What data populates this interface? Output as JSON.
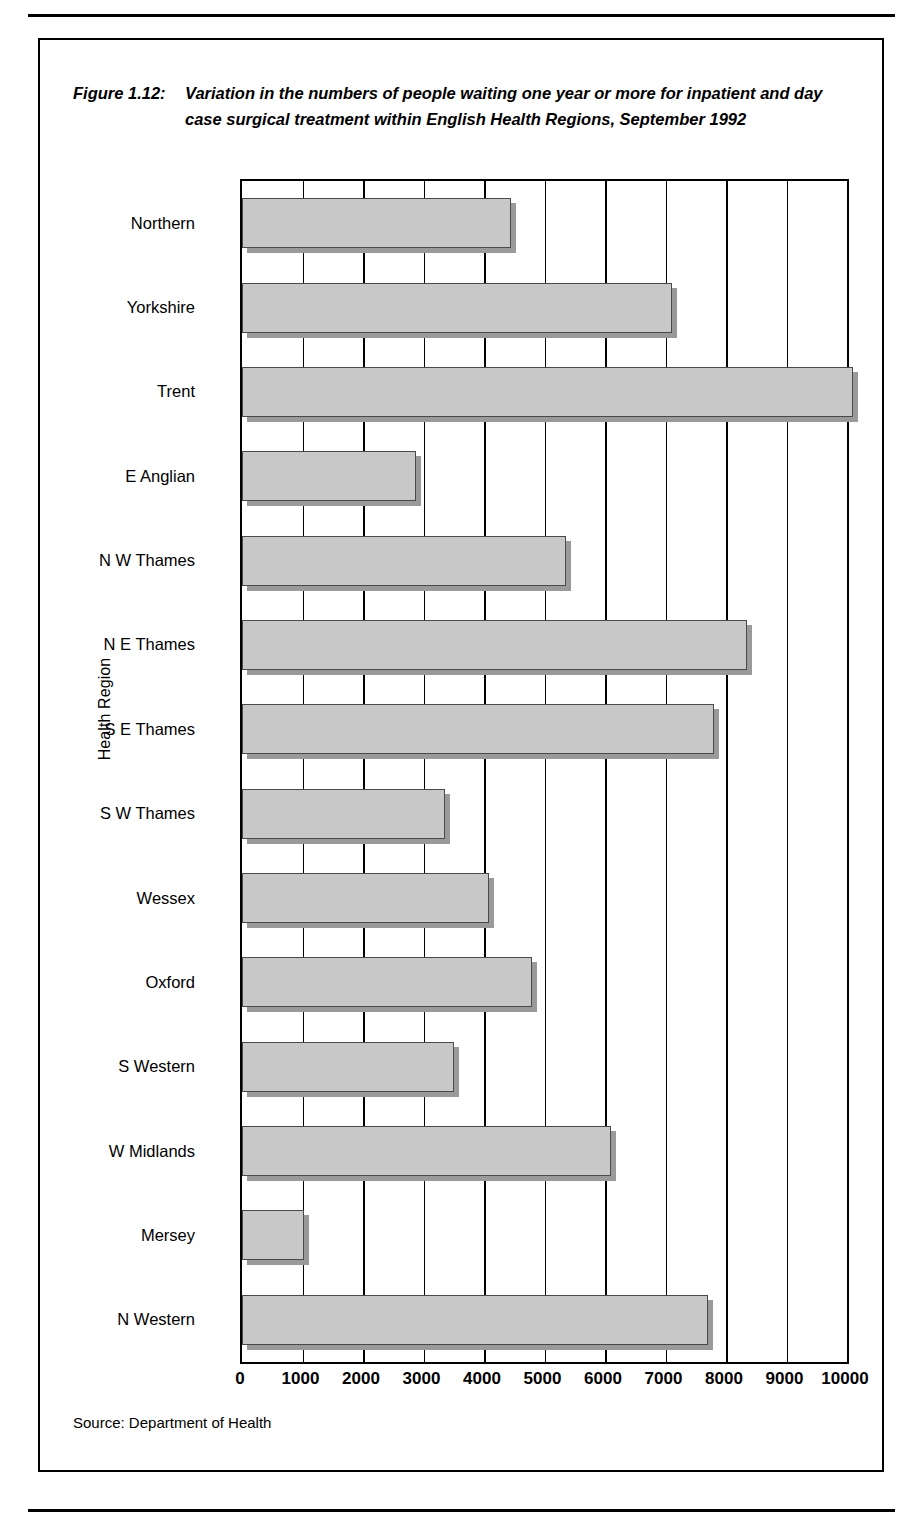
{
  "figure": {
    "number": "Figure 1.12:",
    "caption": "Variation in the numbers of people waiting one year or more for inpatient and day case surgical treatment within English Health Regions, September 1992",
    "source": "Source: Department of Health"
  },
  "chart_data": {
    "type": "bar",
    "orientation": "horizontal",
    "title": "Variation in the numbers of people waiting one year or more for inpatient and day case surgical treatment within English Health Regions, September 1992",
    "xlabel": "",
    "ylabel": "Health Region",
    "xlim": [
      0,
      10000
    ],
    "xticks": [
      0,
      1000,
      2000,
      3000,
      4000,
      5000,
      6000,
      7000,
      8000,
      9000,
      10000
    ],
    "xtick_labels": [
      "0",
      "1000",
      "2000",
      "3000",
      "4000",
      "5000",
      "6000",
      "7000",
      "8000",
      "9000",
      "10000"
    ],
    "grid": "vertical",
    "legend": "none",
    "bar_color": "#c8c8c8",
    "bar_edge_color": "#4a4a4a",
    "bar_shadow_color": "#9a9a9a",
    "categories": [
      "Northern",
      "Yorkshire",
      "Trent",
      "E Anglian",
      "N W Thames",
      "N E Thames",
      "S E Thames",
      "S W Thames",
      "Wessex",
      "Oxford",
      "S Western",
      "W Midlands",
      "Mersey",
      "N Western"
    ],
    "values": [
      4450,
      7100,
      10100,
      2880,
      5350,
      8350,
      7800,
      3350,
      4080,
      4800,
      3500,
      6100,
      1030,
      7700
    ]
  }
}
